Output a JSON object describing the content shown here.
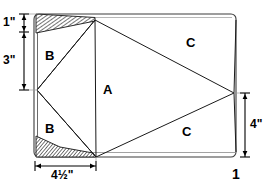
{
  "figure": {
    "figure_number": "1",
    "background_color": "#ffffff",
    "line_color": "#000000",
    "hatch_color": "#555555"
  },
  "regions": [
    {
      "id": "A",
      "label": "A",
      "description": "central pentagon region"
    },
    {
      "id": "B1",
      "label": "B",
      "description": "upper-left triangular region"
    },
    {
      "id": "B2",
      "label": "B",
      "description": "lower-left triangular region"
    },
    {
      "id": "C1",
      "label": "C",
      "description": "upper-right triangular region"
    },
    {
      "id": "C2",
      "label": "C",
      "description": "lower-right triangular region"
    }
  ],
  "dimensions": [
    {
      "id": "top-left-vertical",
      "label": "1\"",
      "value": 1,
      "unit": "inch",
      "orientation": "vertical",
      "position": "left"
    },
    {
      "id": "left-vertical",
      "label": "3\"",
      "value": 3,
      "unit": "inch",
      "orientation": "vertical",
      "position": "left"
    },
    {
      "id": "right-vertical",
      "label": "4\"",
      "value": 4,
      "unit": "inch",
      "orientation": "vertical",
      "position": "right"
    },
    {
      "id": "bottom-horizontal",
      "label": "4½\"",
      "value": 4.5,
      "unit": "inch",
      "orientation": "horizontal",
      "position": "bottom"
    }
  ],
  "geometry": {
    "outer_rect": {
      "x": 34,
      "y": 14,
      "width": 202,
      "height": 143,
      "corner_radius": 5
    },
    "vertices": {
      "top": {
        "x": 95,
        "y": 20
      },
      "left": {
        "x": 37,
        "y": 90
      },
      "bottom": {
        "x": 96,
        "y": 157
      },
      "right": {
        "x": 234,
        "y": 93
      }
    },
    "hatched_wedges": [
      {
        "id": "top-wedge",
        "points": "36,14 95,18 95,21 36,32"
      },
      {
        "id": "bottom-wedge",
        "points": "36,137 36,157 96,157 92,152"
      }
    ]
  }
}
